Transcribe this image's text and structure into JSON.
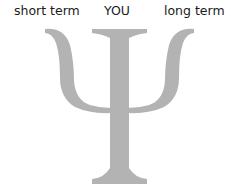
{
  "labels": {
    "short_term": "short term",
    "you": "YOU",
    "long_term": "long term"
  },
  "symbol": {
    "name": "psi",
    "glyph": "Ψ",
    "color": "#b3b3b3"
  }
}
